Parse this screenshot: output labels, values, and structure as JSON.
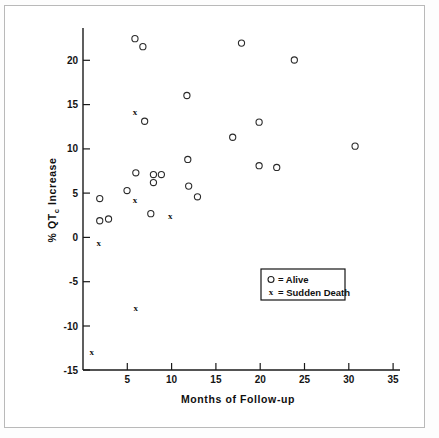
{
  "figure": {
    "title": "",
    "background": "#ffffff",
    "frame_color": "#b9b9b9"
  },
  "chart_data": {
    "type": "scatter",
    "title": "",
    "xlabel": "Months of Follow-up",
    "ylabel": "% QTc Increase",
    "ylabel_main": "% QT",
    "ylabel_subscript": "c",
    "ylabel_tail": " Increase",
    "xlim": [
      0,
      36
    ],
    "ylim": [
      -15,
      23.5
    ],
    "xticks": [
      5,
      10,
      15,
      20,
      25,
      30,
      35
    ],
    "xticklabels": [
      "5",
      "10",
      "15",
      "20",
      "25",
      "30",
      "35"
    ],
    "yticks": [
      -15,
      -10,
      -5,
      0,
      5,
      10,
      15,
      20
    ],
    "yticklabels": [
      "-15",
      "-10",
      "-5",
      "0",
      "5",
      "10",
      "15",
      "20"
    ],
    "grid": false,
    "legend_position": "center-right",
    "series": [
      {
        "name": "Alive",
        "marker": "circle",
        "legend_label": "o = Alive",
        "legend_symbol": "o",
        "legend_text": "= Alive",
        "color": "#2b2b2b",
        "points": [
          {
            "x": 1.9,
            "y": 4.3
          },
          {
            "x": 1.9,
            "y": 1.8
          },
          {
            "x": 2.9,
            "y": 2.0
          },
          {
            "x": 5.0,
            "y": 5.2
          },
          {
            "x": 5.9,
            "y": 22.3
          },
          {
            "x": 6.0,
            "y": 7.2
          },
          {
            "x": 6.8,
            "y": 21.4
          },
          {
            "x": 7.0,
            "y": 13.0
          },
          {
            "x": 7.7,
            "y": 2.6
          },
          {
            "x": 8.0,
            "y": 7.0
          },
          {
            "x": 8.0,
            "y": 6.1
          },
          {
            "x": 8.9,
            "y": 7.0
          },
          {
            "x": 11.8,
            "y": 15.9
          },
          {
            "x": 11.9,
            "y": 8.7
          },
          {
            "x": 12.0,
            "y": 5.7
          },
          {
            "x": 13.0,
            "y": 4.5
          },
          {
            "x": 17.0,
            "y": 11.2
          },
          {
            "x": 18.0,
            "y": 21.8
          },
          {
            "x": 20.0,
            "y": 12.9
          },
          {
            "x": 20.0,
            "y": 8.0
          },
          {
            "x": 22.0,
            "y": 7.8
          },
          {
            "x": 24.0,
            "y": 19.9
          },
          {
            "x": 30.9,
            "y": 10.2
          }
        ]
      },
      {
        "name": "Sudden Death",
        "marker": "x",
        "legend_label": "x = Sudden Death",
        "legend_symbol": "x",
        "legend_text": "= Sudden Death",
        "color": "#111111",
        "points": [
          {
            "x": 1.0,
            "y": -13.1
          },
          {
            "x": 1.8,
            "y": -0.8
          },
          {
            "x": 5.9,
            "y": 13.9
          },
          {
            "x": 5.9,
            "y": 4.0
          },
          {
            "x": 6.0,
            "y": -8.1
          },
          {
            "x": 9.9,
            "y": 2.2
          }
        ]
      }
    ]
  },
  "legend": {
    "entries": [
      {
        "symbol": "o",
        "label": "= Alive"
      },
      {
        "symbol": "x",
        "label": "= Sudden Death"
      }
    ]
  }
}
